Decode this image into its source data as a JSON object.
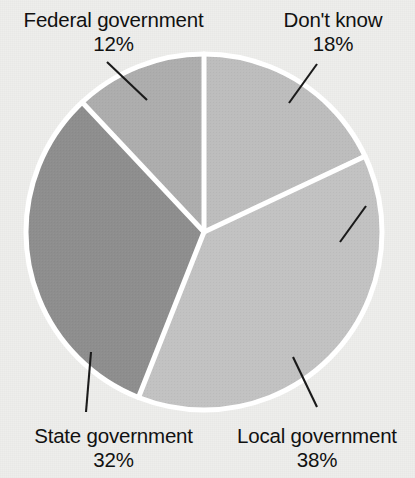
{
  "chart_data": {
    "type": "pie",
    "title": "",
    "subtitle": "",
    "xlabel": "",
    "ylabel": "",
    "legend_position": "none",
    "grid": false,
    "units": "percent",
    "start_angle_deg": 0,
    "direction": "clockwise",
    "categories": [
      "Don't know",
      "Local government",
      "State government",
      "Federal government"
    ],
    "values": [
      18,
      38,
      32,
      12
    ],
    "slices": [
      {
        "label": "Don't know",
        "percent_text": "18%",
        "value": 18,
        "color": "#bdbdbd",
        "start_deg": 0,
        "end_deg": 64.8
      },
      {
        "label": "Local government",
        "percent_text": "38%",
        "value": 38,
        "color": "#c2c2c2",
        "start_deg": 64.8,
        "end_deg": 201.6
      },
      {
        "label": "State government",
        "percent_text": "32%",
        "value": 32,
        "color": "#8e8e8e",
        "start_deg": 201.6,
        "end_deg": 316.8
      },
      {
        "label": "Federal government",
        "percent_text": "12%",
        "value": 12,
        "color": "#adadad",
        "start_deg": 316.8,
        "end_deg": 360
      }
    ]
  },
  "labels": {
    "federal": {
      "name": "Federal government",
      "percent": "12%"
    },
    "dont_know": {
      "name": "Don't know",
      "percent": "18%"
    },
    "state": {
      "name": "State government",
      "percent": "32%"
    },
    "local": {
      "name": "Local government",
      "percent": "38%"
    }
  },
  "style": {
    "background_color": "#eeeeec",
    "separator_color": "#ffffff",
    "leader_line_color": "#1a1a1a",
    "text_color": "#111111"
  }
}
